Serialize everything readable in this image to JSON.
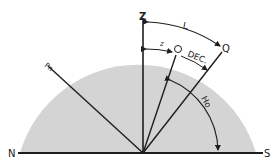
{
  "diagram": {
    "colors": {
      "sphere_fill": "#d4d4d4",
      "line": "#1e1e1e",
      "background": "#ffffff"
    },
    "labels": {
      "zenith": "Z",
      "equator_point": "Q",
      "body": "O",
      "pole": "Pn",
      "north": "N",
      "south": "S",
      "latitude": "L",
      "zenith_distance": "z",
      "declination": "DEC.",
      "observed_altitude": "Ho"
    }
  }
}
